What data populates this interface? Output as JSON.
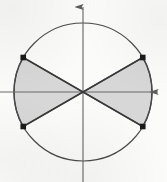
{
  "figure": {
    "caption": "",
    "background_color": "#fbfbfa",
    "width": 167,
    "height": 182
  },
  "chart_data": {
    "type": "scatter",
    "subtitle": "",
    "xlabel": "",
    "ylabel": "",
    "grid": false,
    "legend": "none",
    "axis_style": {
      "x_axis": {
        "name": "x-axis",
        "y_value": 0,
        "arrow_at": "right",
        "color": "#6b6b6b",
        "pixel_y": 92,
        "pixel_x_start": 0,
        "pixel_x_end": 161
      },
      "y_axis": {
        "name": "y-axis",
        "x_value": 0,
        "arrow_at": "top",
        "color": "#6b6b6b",
        "pixel_x": 83,
        "pixel_y_start": 4,
        "pixel_y_end": 182
      }
    },
    "circle": {
      "name": "circle",
      "center": [
        0,
        0
      ],
      "radius": 1,
      "pixel_center": [
        83,
        92
      ],
      "pixel_radius": 69,
      "stroke": "#4a4a4a",
      "fill": "none"
    },
    "shaded_sectors": [
      {
        "name": "right-sector",
        "start_angle_deg": -30,
        "end_angle_deg": 30,
        "sweep_deg": 60,
        "fill": "#d7d7d7",
        "stroke": "#3a3a3a"
      },
      {
        "name": "left-sector",
        "start_angle_deg": 150,
        "end_angle_deg": 210,
        "sweep_deg": 60,
        "fill": "#d7d7d7",
        "stroke": "#3a3a3a"
      }
    ],
    "boundary_lines": [
      {
        "name": "line-plus-30",
        "angle_deg": 30,
        "slope": 0.5774,
        "description": "chord through origin at +30 degrees"
      },
      {
        "name": "line-minus-30",
        "angle_deg": -30,
        "slope": -0.5774,
        "description": "chord through origin at -30 degrees"
      }
    ],
    "points": [
      {
        "name": "point-upper-left",
        "angle_deg": 150,
        "x": -0.866,
        "y": 0.5,
        "pixel": [
          23,
          58
        ],
        "marker": "square",
        "color": "#1a1a1a"
      },
      {
        "name": "point-upper-right",
        "angle_deg": 30,
        "x": 0.866,
        "y": 0.5,
        "pixel": [
          143,
          58
        ],
        "marker": "square",
        "color": "#1a1a1a"
      },
      {
        "name": "point-lower-left",
        "angle_deg": 210,
        "x": -0.866,
        "y": -0.5,
        "pixel": [
          23,
          126
        ],
        "marker": "square",
        "color": "#1a1a1a"
      },
      {
        "name": "point-lower-right",
        "angle_deg": -30,
        "x": 0.866,
        "y": -0.5,
        "pixel": [
          143,
          126
        ],
        "marker": "square",
        "color": "#1a1a1a"
      }
    ],
    "xlim": [
      -1.203,
      1.203
    ],
    "ylim": [
      -1.304,
      1.275
    ],
    "annotations": []
  }
}
